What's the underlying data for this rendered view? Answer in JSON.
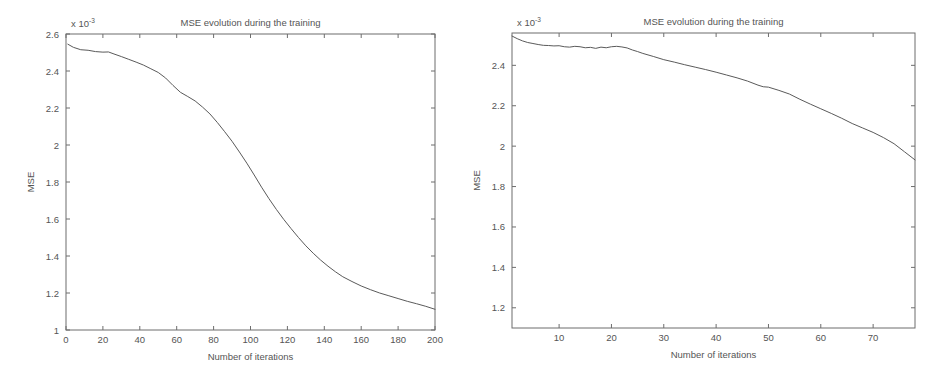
{
  "figure": {
    "background_color": "#ffffff",
    "axis_color": "#6d6d6d",
    "curve_color": "#5a5a5a",
    "text_color": "#555555"
  },
  "chart_data": [
    {
      "id": "left",
      "type": "line",
      "title": "MSE evolution during the training",
      "xlabel": "Number of iterations",
      "ylabel": "MSE",
      "y_exponent_base": "x 10",
      "y_exponent_power": "-3",
      "y_scale_note": "values in units of 1e-3",
      "grid": false,
      "legend": "none",
      "xlim": [
        0,
        200
      ],
      "ylim": [
        1,
        2.6
      ],
      "xticks": [
        0,
        20,
        40,
        60,
        80,
        100,
        120,
        140,
        160,
        180,
        200
      ],
      "xticklabels": [
        "0",
        "20",
        "40",
        "60",
        "80",
        "100",
        "120",
        "140",
        "160",
        "180",
        "200"
      ],
      "yticks": [
        1,
        1.2,
        1.4,
        1.6,
        1.8,
        2,
        2.2,
        2.4,
        2.6
      ],
      "yticklabels": [
        "1",
        "1.2",
        "1.4",
        "1.6",
        "1.8",
        "2",
        "2.2",
        "2.4",
        "2.6"
      ],
      "x": [
        1,
        4,
        8,
        12,
        16,
        20,
        23,
        26,
        30,
        34,
        38,
        42,
        46,
        50,
        54,
        58,
        62,
        66,
        70,
        74,
        78,
        82,
        86,
        90,
        94,
        98,
        102,
        106,
        110,
        114,
        118,
        122,
        126,
        130,
        134,
        138,
        142,
        146,
        150,
        155,
        160,
        165,
        170,
        175,
        180,
        185,
        190,
        195,
        200
      ],
      "y": [
        2.545,
        2.528,
        2.515,
        2.512,
        2.505,
        2.502,
        2.503,
        2.492,
        2.478,
        2.463,
        2.448,
        2.432,
        2.412,
        2.392,
        2.362,
        2.322,
        2.285,
        2.262,
        2.238,
        2.205,
        2.168,
        2.122,
        2.072,
        2.02,
        1.962,
        1.902,
        1.838,
        1.772,
        1.71,
        1.652,
        1.598,
        1.548,
        1.5,
        1.455,
        1.415,
        1.378,
        1.345,
        1.315,
        1.288,
        1.262,
        1.238,
        1.218,
        1.2,
        1.185,
        1.17,
        1.155,
        1.142,
        1.128,
        1.112
      ]
    },
    {
      "id": "right",
      "type": "line",
      "title": "MSE evolution during the training",
      "xlabel": "Number of iterations",
      "ylabel": "MSE",
      "y_exponent_base": "x 10",
      "y_exponent_power": "-3",
      "y_scale_note": "values in units of 1e-3",
      "grid": false,
      "legend": "none",
      "xlim": [
        1,
        78
      ],
      "ylim": [
        1.1,
        2.56
      ],
      "xticks": [
        10,
        20,
        30,
        40,
        50,
        60,
        70
      ],
      "xticklabels": [
        "10",
        "20",
        "30",
        "40",
        "50",
        "60",
        "70"
      ],
      "yticks": [
        1.2,
        1.4,
        1.6,
        1.8,
        2,
        2.2,
        2.4
      ],
      "yticklabels": [
        "1.2",
        "1.4",
        "1.6",
        "1.8",
        "2",
        "2.2",
        "2.4"
      ],
      "x": [
        1,
        2,
        3,
        4,
        5,
        6,
        7,
        8,
        9,
        10,
        11,
        12,
        13,
        14,
        15,
        16,
        17,
        18,
        19,
        20,
        21,
        22,
        23,
        24,
        25,
        26,
        28,
        30,
        32,
        34,
        36,
        38,
        40,
        42,
        44,
        46,
        48,
        49,
        50,
        52,
        54,
        56,
        58,
        60,
        62,
        64,
        66,
        68,
        70,
        72,
        74,
        76,
        78
      ],
      "y": [
        2.545,
        2.532,
        2.521,
        2.513,
        2.508,
        2.503,
        2.499,
        2.498,
        2.496,
        2.497,
        2.492,
        2.49,
        2.494,
        2.492,
        2.487,
        2.489,
        2.484,
        2.49,
        2.487,
        2.492,
        2.494,
        2.491,
        2.486,
        2.476,
        2.468,
        2.459,
        2.444,
        2.428,
        2.416,
        2.403,
        2.391,
        2.379,
        2.366,
        2.352,
        2.338,
        2.322,
        2.302,
        2.294,
        2.292,
        2.276,
        2.258,
        2.232,
        2.208,
        2.185,
        2.162,
        2.138,
        2.112,
        2.09,
        2.068,
        2.042,
        2.012,
        1.972,
        1.932
      ]
    }
  ]
}
